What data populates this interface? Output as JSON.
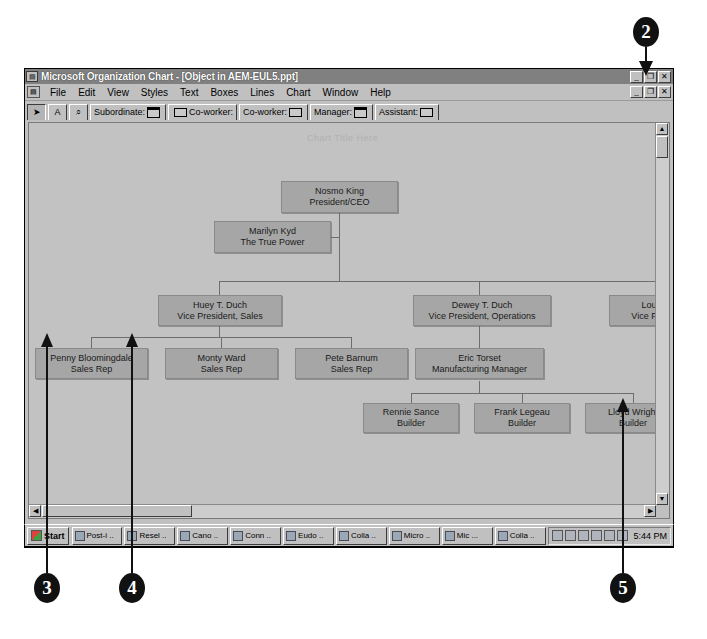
{
  "window": {
    "title": "Microsoft Organization Chart - [Object in AEM-EUL5.ppt]",
    "title_icon": "org-chart-icon",
    "controls": {
      "minimize": "_",
      "restore": "❐",
      "close": "✕"
    },
    "mdi_controls": {
      "minimize": "_",
      "restore": "❐",
      "close": "✕"
    }
  },
  "menubar": {
    "doc_icon": "document-icon",
    "items": [
      {
        "label": "File"
      },
      {
        "label": "Edit"
      },
      {
        "label": "View"
      },
      {
        "label": "Styles"
      },
      {
        "label": "Text"
      },
      {
        "label": "Boxes"
      },
      {
        "label": "Lines"
      },
      {
        "label": "Chart"
      },
      {
        "label": "Window"
      },
      {
        "label": "Help"
      }
    ]
  },
  "toolbar": {
    "buttons": [
      {
        "name": "select-arrow-tool",
        "label": "➤",
        "icon": "arrow-pointer-icon",
        "pressed": true
      },
      {
        "name": "text-tool",
        "label": "A",
        "icon": "text-a-icon",
        "pressed": false
      },
      {
        "name": "zoom-tool",
        "label": "⌕",
        "icon": "magnifier-icon",
        "pressed": false
      },
      {
        "name": "subordinate-tool",
        "label": "Subordinate:",
        "icon": "subordinate-box-icon",
        "pressed": false
      },
      {
        "name": "coworker-left-tool",
        "label": "Co-worker:",
        "icon": "coworker-left-box-icon",
        "pressed": false
      },
      {
        "name": "coworker-right-tool",
        "label": "Co-worker:",
        "icon": "coworker-right-box-icon",
        "pressed": false
      },
      {
        "name": "manager-tool",
        "label": "Manager:",
        "icon": "manager-box-icon",
        "pressed": false
      },
      {
        "name": "assistant-tool",
        "label": "Assistant:",
        "icon": "assistant-box-icon",
        "pressed": false
      }
    ]
  },
  "chart": {
    "watermark": "Chart Title Here",
    "nodes": [
      {
        "id": "ceo",
        "name": "Nosmo King",
        "title": "President/CEO"
      },
      {
        "id": "asst",
        "name": "Marilyn Kyd",
        "title": "The True Power"
      },
      {
        "id": "vpsales",
        "name": "Huey T. Duch",
        "title": "Vice President, Sales"
      },
      {
        "id": "vpops",
        "name": "Dewey T. Duch",
        "title": "Vice President, Operations"
      },
      {
        "id": "vp3",
        "name": "Louie T",
        "title": "Vice Preside"
      },
      {
        "id": "rep1",
        "name": "Penny Bloomingdale",
        "title": "Sales Rep"
      },
      {
        "id": "rep2",
        "name": "Monty Ward",
        "title": "Sales Rep"
      },
      {
        "id": "rep3",
        "name": "Pete Barnum",
        "title": "Sales Rep"
      },
      {
        "id": "mfg",
        "name": "Eric Torset",
        "title": "Manufacturing Manager"
      },
      {
        "id": "bld1",
        "name": "Rennie Sance",
        "title": "Builder"
      },
      {
        "id": "bld2",
        "name": "Frank Legeau",
        "title": "Builder"
      },
      {
        "id": "bld3",
        "name": "Lloyd Wright",
        "title": "Builder"
      }
    ]
  },
  "statusbar": {
    "size_label": "Size",
    "zoom_value": "50%"
  },
  "scrollbars": {
    "up_arrow": "▲",
    "down_arrow": "▼",
    "left_arrow": "◀",
    "right_arrow": "▶"
  },
  "taskbar": {
    "start_label": "Start",
    "buttons": [
      {
        "label": "Post-i .."
      },
      {
        "label": "Resel .."
      },
      {
        "label": "Cano .."
      },
      {
        "label": "Conn .."
      },
      {
        "label": "Eudo .."
      },
      {
        "label": "Colla .."
      },
      {
        "label": "Micro .."
      },
      {
        "label": "Mic ..."
      },
      {
        "label": "Colla .."
      }
    ],
    "tray_icons": [
      "printer-icon",
      "volume-icon",
      "network-icon",
      "modem-icon",
      "pen-icon",
      "fax-icon"
    ],
    "clock": "5:44 PM"
  },
  "callouts": [
    {
      "number": "2"
    },
    {
      "number": "3"
    },
    {
      "number": "4"
    },
    {
      "number": "5"
    }
  ]
}
